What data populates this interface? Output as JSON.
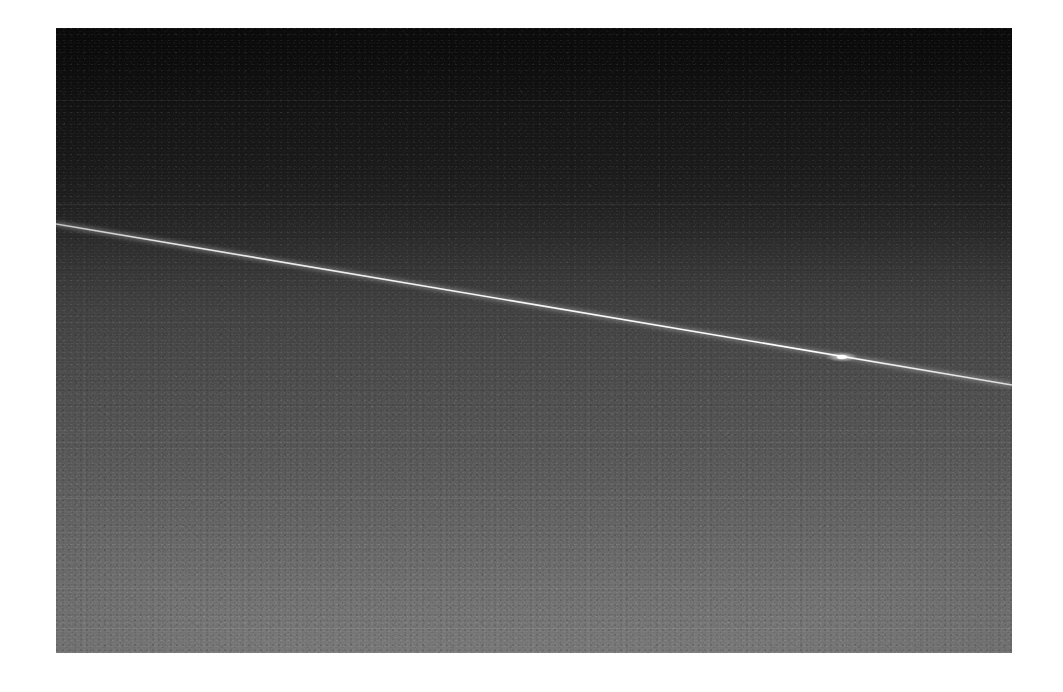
{
  "page": {
    "background_color": "#ffffff",
    "width_px": 1063,
    "height_px": 692
  },
  "photo": {
    "kind": "astronomical-plate",
    "description": "Dark grayscale sky plate with a thin bright diagonal streak",
    "frame": {
      "left_px": 56,
      "top_px": 28,
      "width_px": 956,
      "height_px": 625,
      "border": "none",
      "matte_color": "#ffffff"
    },
    "background_gradient": {
      "direction": "top-to-bottom",
      "top_color": "#0a0a0a",
      "upper_mid_color": "#1a1a1a",
      "mid_color": "#474747",
      "lower_mid_color": "#606060",
      "bottom_color": "#7a7a7a"
    },
    "texture": {
      "type": "sensor-noise",
      "banding": "horizontal",
      "grain_visible_in": "lower-half"
    },
    "seams": [
      {
        "y_px": 72,
        "tone": "light"
      },
      {
        "y_px": 176,
        "tone": "light"
      },
      {
        "y_px": 402,
        "tone": "light"
      },
      {
        "y_px": 470,
        "tone": "light"
      },
      {
        "y_px": 516,
        "tone": "light"
      },
      {
        "y_px": 560,
        "tone": "light"
      },
      {
        "y_px": 600,
        "tone": "light"
      }
    ]
  },
  "streak": {
    "label": "satellite-trail",
    "color": "#f2f2f2",
    "start": {
      "x_px": 0,
      "y_px": 196
    },
    "end": {
      "x_px": 956,
      "y_px": 357
    },
    "width_px": 1.6,
    "glow_width_px": 5,
    "slope_deg": 9.6,
    "flare": {
      "label": "trail-flare",
      "x_px": 786,
      "y_px": 329,
      "radius_px": 9,
      "color": "#ffffff"
    }
  },
  "chart_data": {
    "type": "line",
    "title": "",
    "xlabel": "",
    "ylabel": "",
    "grid": false,
    "legend": "none",
    "x": [
      0,
      956
    ],
    "series": [
      {
        "name": "satellite-trail",
        "values": [
          196,
          357
        ]
      }
    ],
    "xlim": [
      0,
      956
    ],
    "ylim": [
      625,
      0
    ]
  }
}
